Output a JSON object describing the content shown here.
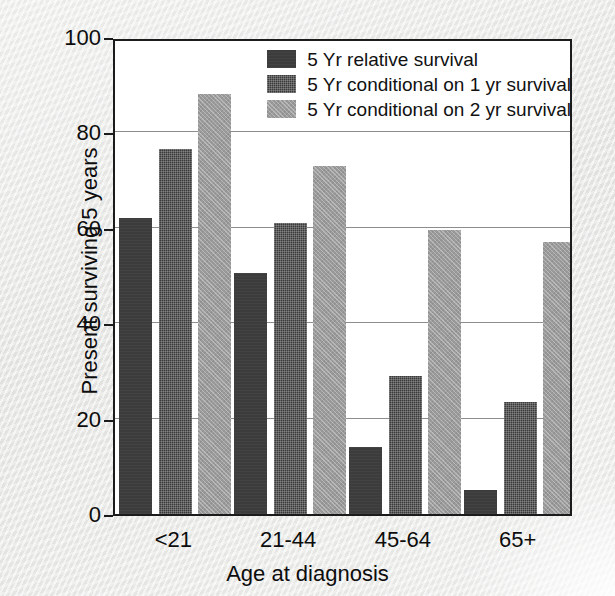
{
  "chart_data": {
    "type": "bar",
    "title": "",
    "subtitle": "",
    "xlabel": "Age at diagnosis",
    "ylabel": "Present surviving 5 years",
    "categories": [
      "<21",
      "21-44",
      "45-64",
      "65+"
    ],
    "series": [
      {
        "name": "5 Yr relative survival",
        "color": "#3c3c3c",
        "values": [
          62,
          50.5,
          14,
          5
        ]
      },
      {
        "name": "5 Yr conditional on 1 yr survival",
        "color": "#3a3a3a",
        "values": [
          76.5,
          61,
          29,
          23.5
        ]
      },
      {
        "name": "5 Yr conditional on 2 yr survival",
        "color": "#9b9b9b",
        "values": [
          88,
          73,
          59.5,
          57
        ]
      }
    ],
    "ylim": [
      0,
      100
    ],
    "yticks": [
      0,
      20,
      40,
      60,
      80,
      100
    ],
    "ytick_labels": [
      "0",
      "20",
      "40",
      "60",
      "80",
      "100"
    ],
    "grid": "horizontal",
    "legend_position": "top-right-inside"
  },
  "legend": {
    "entries": [
      {
        "label": "5 Yr relative survival",
        "swatch": "series-0-swatch"
      },
      {
        "label": "5 Yr conditional on 1 yr survival",
        "swatch": "series-1-swatch"
      },
      {
        "label": "5 Yr conditional on 2 yr survival",
        "swatch": "series-2-swatch"
      }
    ]
  },
  "colors": {
    "background": "#e9e9e7",
    "plot_background": "#ffffff",
    "axis": "#1b1b1b",
    "gridline": "#8d8d8d",
    "text": "#0d0d0d"
  }
}
